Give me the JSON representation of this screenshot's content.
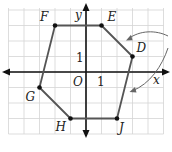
{
  "figure": {
    "type": "coordinate-plane-polygon",
    "grid": {
      "xmin": -5,
      "xmax": 5,
      "ymin": -4,
      "ymax": 4,
      "unit_px": 15.5,
      "origin_px": [
        86,
        72
      ],
      "color": "#d4d4d4"
    },
    "axes": {
      "x_label": "x",
      "y_label": "y",
      "origin_label": "O",
      "x_tick_label": "1",
      "y_tick_label": "1",
      "color": "#111111"
    },
    "polygon": {
      "stroke": "#555555",
      "vertices": [
        {
          "name": "D",
          "x": 3,
          "y": 1
        },
        {
          "name": "E",
          "x": 1,
          "y": 3
        },
        {
          "name": "F",
          "x": -2,
          "y": 3
        },
        {
          "name": "G",
          "x": -3,
          "y": -1
        },
        {
          "name": "H",
          "x": -1,
          "y": -3
        },
        {
          "name": "J",
          "x": 2,
          "y": -3
        }
      ]
    },
    "arrows": {
      "count": 2,
      "color": "#666666"
    }
  }
}
